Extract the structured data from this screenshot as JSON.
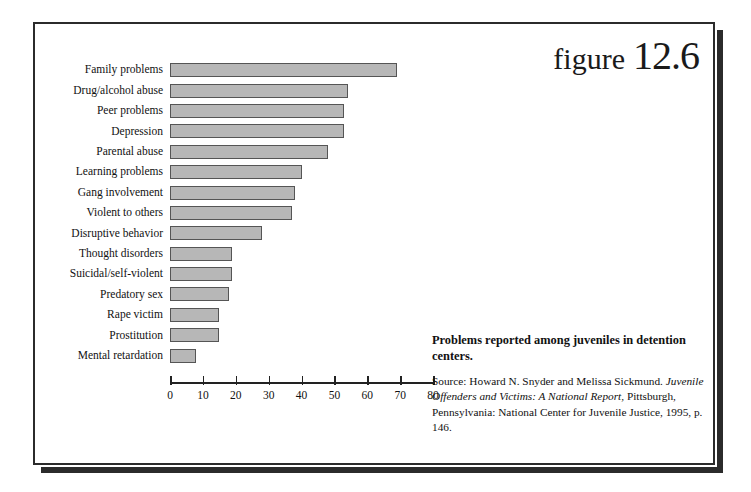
{
  "figure": {
    "word": "figure",
    "number": "12.6"
  },
  "caption": {
    "title": "Problems reported among juveniles in detention centers.",
    "source_prefix": "Source: Howard N. Snyder and Melissa Sickmund.",
    "source_italic": "Juvenile Offenders and Victims: A National Report,",
    "source_rest": " Pittsburgh, Pennsylvania: National Center for Juvenile Justice, 1995, p. 146."
  },
  "colors": {
    "bar_fill": "#b7b7b7",
    "bar_stroke": "#555555",
    "frame": "#2b2b2b",
    "text": "#111111"
  },
  "chart_data": {
    "type": "bar",
    "orientation": "horizontal",
    "title": "Problems reported among juveniles in detention centers.",
    "xlabel": "",
    "ylabel": "",
    "xlim": [
      0,
      80
    ],
    "xticks": [
      0,
      10,
      20,
      30,
      40,
      50,
      60,
      70,
      80
    ],
    "grid": false,
    "legend": "none",
    "categories": [
      "Family problems",
      "Drug/alcohol abuse",
      "Peer problems",
      "Depression",
      "Parental abuse",
      "Learning problems",
      "Gang involvement",
      "Violent to others",
      "Disruptive behavior",
      "Thought disorders",
      "Suicidal/self-violent",
      "Predatory sex",
      "Rape victim",
      "Prostitution",
      "Mental retardation"
    ],
    "values": [
      69,
      54,
      53,
      53,
      48,
      40,
      38,
      37,
      28,
      19,
      19,
      18,
      15,
      15,
      8
    ]
  }
}
